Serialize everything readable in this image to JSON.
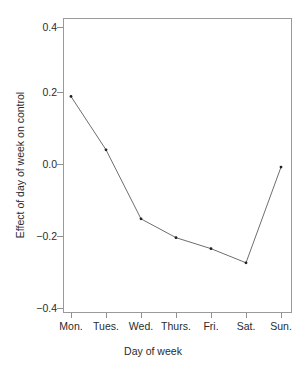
{
  "chart_data": {
    "type": "line",
    "title": "",
    "xlabel": "Day of week",
    "ylabel": "Effect of day of week on control",
    "categories": [
      "Mon.",
      "Tues.",
      "Wed.",
      "Thurs.",
      "Fri.",
      "Sat.",
      "Sun."
    ],
    "values": [
      0.22,
      0.05,
      -0.17,
      -0.23,
      -0.265,
      -0.31,
      -0.005
    ],
    "series": [
      {
        "name": "Effect of day of week on control",
        "values": [
          0.22,
          0.05,
          -0.17,
          -0.23,
          -0.265,
          -0.31,
          -0.005
        ]
      }
    ],
    "ylim": [
      -0.47,
      0.47
    ],
    "yticks": [
      0.4,
      0.2,
      0.0,
      -0.2,
      -0.4
    ],
    "ytick_labels": [
      "0.4",
      "0.2",
      "0.0",
      "−0.2",
      "−0.4"
    ],
    "grid": false,
    "legend": false,
    "marker": "point",
    "line_color": "#6e6e6e",
    "point_color": "#1f1f1f",
    "frame_color": "#9a9a9a",
    "background": "#ffffff"
  }
}
